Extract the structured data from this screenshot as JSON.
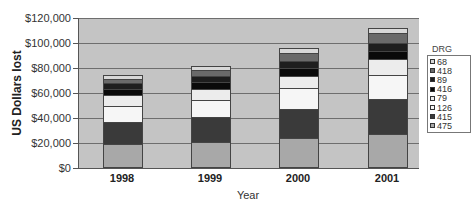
{
  "chart_data": {
    "type": "bar",
    "stacked": true,
    "title": "",
    "xlabel": "Year",
    "ylabel": "US Dollars lost",
    "ylim": [
      0,
      120000
    ],
    "yticks": [
      "$0",
      "$20,000",
      "$40,000",
      "$60,000",
      "$80,000",
      "$100,000",
      "$120,000"
    ],
    "ytick_values": [
      0,
      20000,
      40000,
      60000,
      80000,
      100000,
      120000
    ],
    "categories": [
      "1998",
      "1999",
      "2000",
      "2001"
    ],
    "legend_title": "DRG",
    "legend_position": "right",
    "grid": true,
    "series": [
      {
        "name": "475",
        "color": "#a8a8a8",
        "values": [
          18400,
          20000,
          23200,
          26400
        ]
      },
      {
        "name": "415",
        "color": "#3a3a3a",
        "values": [
          17600,
          20000,
          23200,
          28000
        ]
      },
      {
        "name": "126",
        "color": "#f6f6f6",
        "values": [
          12800,
          13600,
          16800,
          19200
        ]
      },
      {
        "name": "79",
        "color": "#ececec",
        "values": [
          8800,
          8800,
          9600,
          12800
        ]
      },
      {
        "name": "416",
        "color": "#0a0a0a",
        "values": [
          5000,
          5400,
          6400,
          6800
        ]
      },
      {
        "name": "89",
        "color": "#1e1e1e",
        "values": [
          4600,
          5000,
          5600,
          6000
        ]
      },
      {
        "name": "418",
        "color": "#6a6a6a",
        "values": [
          3200,
          4800,
          6400,
          8000
        ]
      },
      {
        "name": "68",
        "color": "#d8d8d8",
        "values": [
          4000,
          4000,
          4800,
          4800
        ]
      }
    ],
    "legend_order": [
      "68",
      "418",
      "89",
      "416",
      "79",
      "126",
      "415",
      "475"
    ]
  }
}
